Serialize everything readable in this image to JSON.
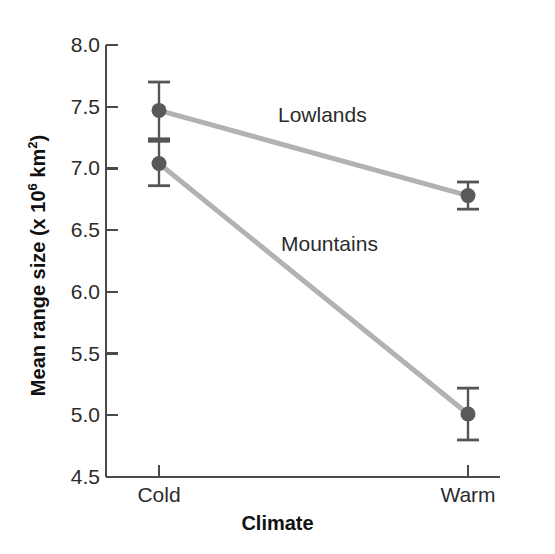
{
  "chart_data": {
    "type": "line",
    "title": "",
    "subtitle": "",
    "xlabel": "Climate",
    "ylabel": "Mean range size (x 10⁶ km²)",
    "ylabel_parts": {
      "before": "Mean range size (x 10",
      "exponent": "6",
      "after": " km",
      "exponent2": "2",
      "tail": ")"
    },
    "categories": [
      "Cold",
      "Warm"
    ],
    "x": [
      0,
      1
    ],
    "ylim": [
      4.5,
      8.0
    ],
    "yticks": [
      4.5,
      5.0,
      5.5,
      6.0,
      6.5,
      7.0,
      7.5,
      8.0
    ],
    "ytick_labels": [
      "4.5",
      "5.0",
      "5.5",
      "6.0",
      "6.5",
      "7.0",
      "7.5",
      "8.0"
    ],
    "xtick_labels": [
      "Cold",
      "Warm"
    ],
    "grid": false,
    "legend_position": "inline-annotations",
    "error_type": "error-bars",
    "series": [
      {
        "name": "Lowlands",
        "values": [
          7.47,
          6.78
        ],
        "errors": [
          0.23,
          0.11
        ],
        "line_color": "#b2b2b2",
        "marker_color": "#595959",
        "annotation_label": "Lowlands"
      },
      {
        "name": "Mountains",
        "values": [
          7.04,
          5.01
        ],
        "errors": [
          0.18,
          0.21
        ],
        "line_color": "#b2b2b2",
        "marker_color": "#595959",
        "annotation_label": "Mountains"
      }
    ],
    "colors": {
      "axis": "#4a4a4a",
      "line": "#b2b2b2",
      "marker": "#595959",
      "error_bar": "#555555",
      "text": "#2b2b2b",
      "background": "#ffffff"
    }
  }
}
